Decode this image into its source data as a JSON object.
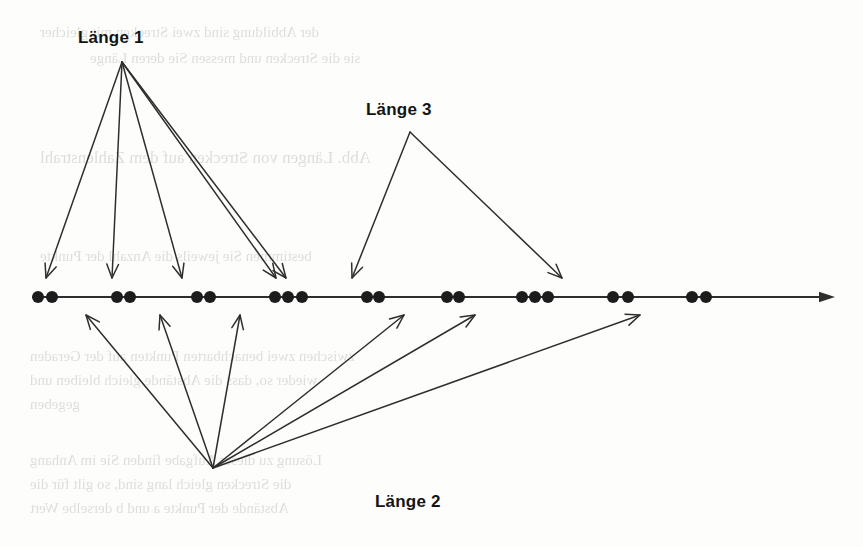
{
  "figure": {
    "type": "number-line-diagram",
    "ink_color": "#2e2e2e",
    "dot_color": "#1c1c1c",
    "background_color": "#fdfdfc",
    "axis": {
      "name": "number-line",
      "x_start": 33,
      "x_end": 835,
      "y": 297,
      "stroke_width": 2.0,
      "arrow_head": "right"
    },
    "dots": [
      {
        "x": 38,
        "y": 297,
        "r": 6.0,
        "group": 1
      },
      {
        "x": 52,
        "y": 297,
        "r": 6.0,
        "group": 1
      },
      {
        "x": 117,
        "y": 297,
        "r": 6.0,
        "group": 2
      },
      {
        "x": 130,
        "y": 297,
        "r": 6.0,
        "group": 2
      },
      {
        "x": 197,
        "y": 297,
        "r": 6.0,
        "group": 3
      },
      {
        "x": 210,
        "y": 297,
        "r": 6.0,
        "group": 3
      },
      {
        "x": 275,
        "y": 297,
        "r": 6.0,
        "group": 4
      },
      {
        "x": 288,
        "y": 297,
        "r": 6.0,
        "group": 4
      },
      {
        "x": 302,
        "y": 297,
        "r": 6.0,
        "group": 4
      },
      {
        "x": 367,
        "y": 297,
        "r": 6.0,
        "group": 5
      },
      {
        "x": 379,
        "y": 297,
        "r": 6.0,
        "group": 5
      },
      {
        "x": 447,
        "y": 297,
        "r": 6.0,
        "group": 6
      },
      {
        "x": 459,
        "y": 297,
        "r": 6.0,
        "group": 6
      },
      {
        "x": 522,
        "y": 297,
        "r": 6.0,
        "group": 7
      },
      {
        "x": 535,
        "y": 297,
        "r": 6.0,
        "group": 7
      },
      {
        "x": 548,
        "y": 297,
        "r": 6.0,
        "group": 7
      },
      {
        "x": 613,
        "y": 297,
        "r": 6.0,
        "group": 8
      },
      {
        "x": 628,
        "y": 297,
        "r": 6.0,
        "group": 8
      },
      {
        "x": 692,
        "y": 297,
        "r": 6.0,
        "group": 9
      },
      {
        "x": 706,
        "y": 297,
        "r": 6.0,
        "group": 9
      }
    ],
    "labels": [
      {
        "id": "laenge-1",
        "text": "Länge 1",
        "x": 78,
        "y": 28,
        "font_size": 17
      },
      {
        "id": "laenge-3",
        "text": "Länge 3",
        "x": 366,
        "y": 100,
        "font_size": 17
      },
      {
        "id": "laenge-2",
        "text": "Länge 2",
        "x": 375,
        "y": 492,
        "font_size": 17
      }
    ],
    "arrow_groups": [
      {
        "id": "laenge-1-arrows",
        "label": "Länge 1",
        "origin": {
          "x": 122,
          "y": 62
        },
        "direction": "down",
        "targets": [
          {
            "x": 46,
            "y": 278
          },
          {
            "x": 112,
            "y": 278
          },
          {
            "x": 182,
            "y": 278
          },
          {
            "x": 276,
            "y": 278
          },
          {
            "x": 286,
            "y": 278
          }
        ]
      },
      {
        "id": "laenge-3-arrows",
        "label": "Länge 3",
        "origin": {
          "x": 410,
          "y": 132
        },
        "direction": "down",
        "targets": [
          {
            "x": 352,
            "y": 278
          },
          {
            "x": 562,
            "y": 278
          }
        ]
      },
      {
        "id": "laenge-2-arrows",
        "label": "Länge 2",
        "origin": {
          "x": 213,
          "y": 468
        },
        "direction": "up",
        "targets": [
          {
            "x": 86,
            "y": 315
          },
          {
            "x": 160,
            "y": 315
          },
          {
            "x": 240,
            "y": 315
          },
          {
            "x": 404,
            "y": 315
          },
          {
            "x": 475,
            "y": 315
          },
          {
            "x": 640,
            "y": 315
          }
        ]
      }
    ]
  },
  "background_bleed": [
    {
      "text": "der Abbildung sind zwei Strecken mit gleicher",
      "x": 40,
      "y": 24,
      "size": 15
    },
    {
      "text": "sie die Strecken und messen Sie deren Länge",
      "x": 90,
      "y": 50,
      "size": 15
    },
    {
      "text": "Abb. Längen von Strecken auf dem Zahlenstrahl",
      "x": 40,
      "y": 148,
      "size": 17
    },
    {
      "text": "bestimmen Sie jeweils die Anzahl der Punkte",
      "x": 40,
      "y": 248,
      "size": 15
    },
    {
      "text": "zwischen zwei benachbarten Punkten auf der Geraden",
      "x": 30,
      "y": 348,
      "size": 15
    },
    {
      "text": "wieder so, dass die Abstände gleich bleiben und",
      "x": 30,
      "y": 372,
      "size": 15
    },
    {
      "text": "gegeben",
      "x": 30,
      "y": 396,
      "size": 15
    },
    {
      "text": "Lösung zu dieser Aufgabe finden Sie im Anhang",
      "x": 30,
      "y": 452,
      "size": 15
    },
    {
      "text": "die Strecken gleich lang sind, so gilt für die",
      "x": 30,
      "y": 476,
      "size": 15
    },
    {
      "text": "Abstände der Punkte a und b derselbe Wert",
      "x": 30,
      "y": 500,
      "size": 15
    }
  ]
}
